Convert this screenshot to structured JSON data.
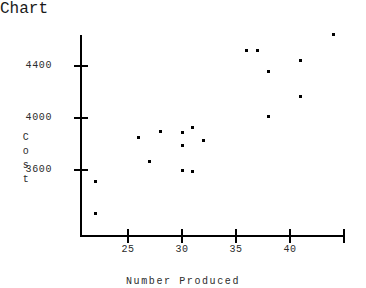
{
  "chart_data": {
    "type": "scatter",
    "title": "",
    "xlabel": "Number Produced",
    "ylabel": "Cost",
    "ylabel_chars": [
      "C",
      "o",
      "s",
      "t"
    ],
    "xlim": [
      21.5,
      45.0
    ],
    "ylim": [
      3200,
      4700
    ],
    "grid": false,
    "legend": null,
    "xticks": [
      25,
      30,
      35,
      40,
      45
    ],
    "xtick_labels": [
      "25",
      "30",
      "35",
      "40",
      ""
    ],
    "yticks": [
      3600,
      4000,
      4400
    ],
    "ytick_labels": [
      "3600",
      "4000",
      "4400"
    ],
    "marker": "square",
    "marker_color": "#000000",
    "points": [
      {
        "x": 22.0,
        "y": 3510
      },
      {
        "x": 22.0,
        "y": 3265
      },
      {
        "x": 26.0,
        "y": 3850
      },
      {
        "x": 27.0,
        "y": 3665
      },
      {
        "x": 28.0,
        "y": 3900
      },
      {
        "x": 30.0,
        "y": 3885
      },
      {
        "x": 30.0,
        "y": 3790
      },
      {
        "x": 30.0,
        "y": 3600
      },
      {
        "x": 31.0,
        "y": 3925
      },
      {
        "x": 31.0,
        "y": 3585
      },
      {
        "x": 32.0,
        "y": 3830
      },
      {
        "x": 36.0,
        "y": 4520
      },
      {
        "x": 37.0,
        "y": 4520
      },
      {
        "x": 38.0,
        "y": 4355
      },
      {
        "x": 38.0,
        "y": 4010
      },
      {
        "x": 41.0,
        "y": 4440
      },
      {
        "x": 41.0,
        "y": 4165
      },
      {
        "x": 44.0,
        "y": 4640
      }
    ]
  },
  "axes": {
    "y_axis_name": "cost-axis",
    "x_axis_name": "number-produced-axis"
  }
}
